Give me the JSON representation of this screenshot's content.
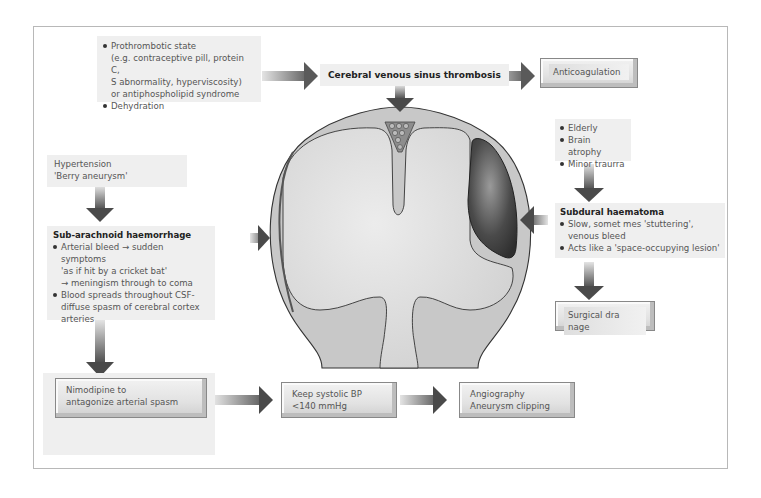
{
  "diagram": {
    "type": "flowchart-with-anatomical-illustration",
    "colors": {
      "frame_border": "#b8b8b8",
      "note_bg": "#efefef",
      "arrow_dark": "#4a4a4a",
      "arrow_light": "#d8d8d8",
      "brain_fill": "#d4d4d4",
      "skull_fill": "#c9c9c9",
      "haematoma_dark": "#3c3c3c"
    },
    "causes_cvst": {
      "items": [
        "Prothrombotic state",
        "Dehydration"
      ],
      "prothrombotic_detail": [
        "(e.g. contraceptive pill, protein C,",
        "S abnormality, hyperviscosity)",
        "or antiphospholipid syndrome"
      ]
    },
    "cvst": {
      "title": "Cerebral venous sinus thrombosis"
    },
    "anticoagulation": {
      "label": "Anticoagulation"
    },
    "causes_sdh": {
      "items": [
        "Elderly",
        "Brain atrophy",
        "Minor traurra"
      ]
    },
    "sdh": {
      "title": "Subdural haematoma",
      "items": [
        "Slow, somet mes 'stuttering', venous bleed",
        "Acts like a 'space-occupying lesion'"
      ]
    },
    "surgical_drainage": {
      "label": "Surgical dra nage"
    },
    "causes_sah": {
      "lines": [
        "Hypertension",
        "'Berry aneurysm'"
      ]
    },
    "sah": {
      "title": "Sub-arachnoid haemorrhage",
      "item1_lines": [
        "Arterial bleed → sudden symptoms",
        "'as if hit by a cricket bat'",
        "→ meningism through to coma"
      ],
      "item2_lines": [
        "Blood spreads throughout CSF-",
        "diffuse spasm of cerebral cortex",
        "arteries"
      ]
    },
    "treatments": [
      {
        "lines": [
          "Nimodipine to",
          "antagonize arterial spasm"
        ]
      },
      {
        "lines": [
          "Keep systolic BP",
          "<140 mmHg"
        ]
      },
      {
        "lines": [
          "Angiography",
          "Aneurysm clipping"
        ]
      }
    ],
    "vessel_icon": {
      "from": "narrow-vessel",
      "to": "dilated-vessel"
    }
  }
}
